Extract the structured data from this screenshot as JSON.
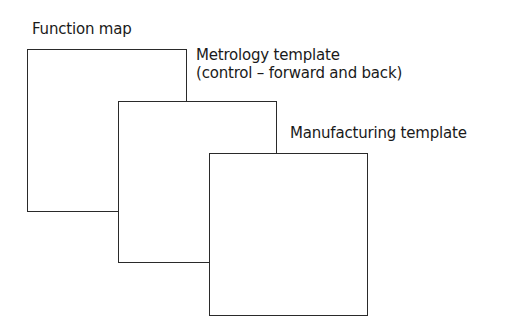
{
  "diagram": {
    "layers": [
      {
        "id": "function-map",
        "label": "Function map",
        "label_line2": ""
      },
      {
        "id": "metrology-template",
        "label": "Metrology template",
        "label_line2": "(control – forward and back)"
      },
      {
        "id": "manufacturing-template",
        "label": "Manufacturing template",
        "label_line2": ""
      }
    ],
    "colors": {
      "stroke": "#2a2a2a",
      "fill": "#ffffff",
      "text": "#1a1a1a"
    }
  }
}
